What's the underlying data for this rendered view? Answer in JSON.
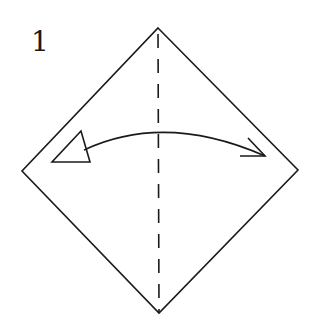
{
  "step": {
    "number": "1"
  },
  "diagram": {
    "colors": {
      "stroke": "#1a1a1a",
      "background": "#ffffff",
      "fill": "#ffffff"
    },
    "paper": {
      "shape": "square-rotated-45",
      "vertices": {
        "top": [
          158,
          28
        ],
        "right": [
          298,
          170
        ],
        "bottom": [
          159,
          313
        ],
        "left": [
          22,
          171
        ]
      }
    },
    "fold_line": {
      "type": "valley-fold-dashed",
      "from": [
        158,
        28
      ],
      "to": [
        159,
        313
      ]
    },
    "arrow": {
      "type": "fold-and-unfold",
      "start_icon": "hollow-triangle-arrowhead",
      "end_icon": "open-arrowhead",
      "path": "M84 150 Q 165 112 265 156"
    }
  }
}
